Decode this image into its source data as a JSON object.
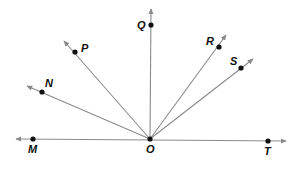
{
  "diagram": {
    "type": "rays-from-common-vertex",
    "vertex": {
      "label": "O",
      "x": 150,
      "y": 139
    },
    "line": {
      "description": "line MT through O",
      "left_end": {
        "x": 16,
        "y": 139
      },
      "right_end": {
        "x": 286,
        "y": 141
      }
    },
    "points": [
      {
        "label": "M",
        "x": 33,
        "y": 139,
        "label_x": 28,
        "label_y": 153
      },
      {
        "label": "O",
        "x": 150,
        "y": 139,
        "label_x": 146,
        "label_y": 153
      },
      {
        "label": "T",
        "x": 268,
        "y": 141,
        "label_x": 264,
        "label_y": 155
      },
      {
        "label": "N",
        "x": 42,
        "y": 92,
        "label_x": 45,
        "label_y": 87
      },
      {
        "label": "P",
        "x": 75,
        "y": 52,
        "label_x": 81,
        "label_y": 52
      },
      {
        "label": "Q",
        "x": 151,
        "y": 25,
        "label_x": 137,
        "label_y": 29
      },
      {
        "label": "R",
        "x": 219,
        "y": 47,
        "label_x": 206,
        "label_y": 45
      },
      {
        "label": "S",
        "x": 241,
        "y": 68,
        "label_x": 230,
        "label_y": 65
      }
    ],
    "rays": [
      {
        "name": "ray-ON",
        "through": "N",
        "tip": {
          "x": 27,
          "y": 86
        }
      },
      {
        "name": "ray-OP",
        "through": "P",
        "tip": {
          "x": 64,
          "y": 41
        }
      },
      {
        "name": "ray-OQ",
        "through": "Q",
        "tip": {
          "x": 151,
          "y": 9
        }
      },
      {
        "name": "ray-OR",
        "through": "R",
        "tip": {
          "x": 226,
          "y": 35
        }
      },
      {
        "name": "ray-OS",
        "through": "S",
        "tip": {
          "x": 253,
          "y": 59
        }
      }
    ],
    "colors": {
      "ray": "#8a8a8a",
      "point": "#111111",
      "label": "#111111",
      "background": "#ffffff"
    }
  }
}
